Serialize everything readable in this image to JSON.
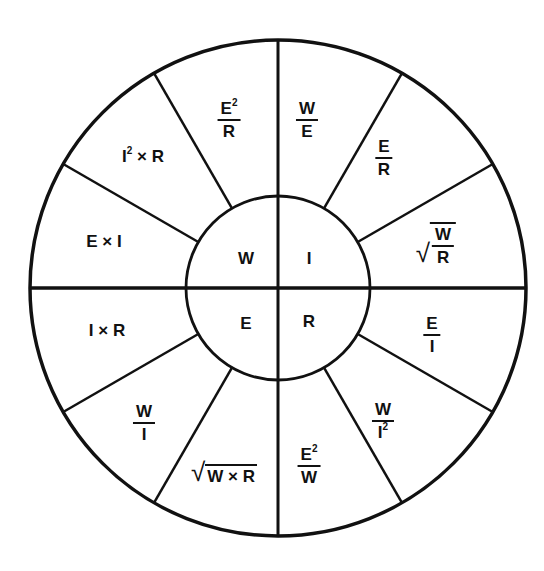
{
  "diagram": {
    "title": "",
    "type": "power wheel",
    "stroke_color": "#111111",
    "background_color": "#ffffff",
    "inner": {
      "top_left": "W",
      "top_right": "I",
      "bottom_left": "E",
      "bottom_right": "R"
    },
    "outer": {
      "e2_over_r": {
        "num": "E",
        "sup": "2",
        "den": "R"
      },
      "w_over_e": {
        "num": "W",
        "den": "E"
      },
      "e_over_r": {
        "num": "E",
        "den": "R"
      },
      "sqrt_w_over_r": {
        "radical": "√",
        "num": "W",
        "den": "R"
      },
      "e_over_i": {
        "num": "E",
        "den": "I"
      },
      "w_over_i2": {
        "num": "W",
        "den": "I",
        "sup": "2"
      },
      "e2_over_w": {
        "num": "E",
        "sup": "2",
        "den": "W"
      },
      "sqrt_w_times_r": {
        "radical": "√",
        "body": "W × R"
      },
      "w_over_i": {
        "num": "W",
        "den": "I"
      },
      "i_times_r": "I × R",
      "e_times_i": "E × I",
      "i2_times_r": {
        "base": "I",
        "sup": "2",
        "rest": " × R"
      }
    }
  }
}
